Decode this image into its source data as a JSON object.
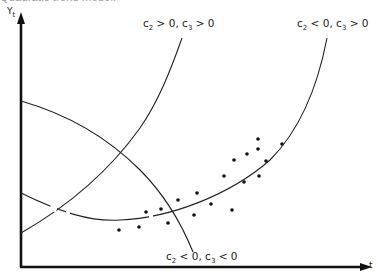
{
  "caption": "Quadratic trend model.",
  "axes": {
    "y_label": "Y",
    "y_subscript": "t",
    "x_label": "t"
  },
  "curves": [
    {
      "label_c2": "c",
      "sub2": "2",
      "rel2": " > 0, ",
      "label_c3": "c",
      "sub3": "3",
      "rel3": " > 0",
      "description": "c2 > 0, c3 > 0"
    },
    {
      "label_c2": "c",
      "sub2": "2",
      "rel2": " < 0, ",
      "label_c3": "c",
      "sub3": "3",
      "rel3": " > 0",
      "description": "c2 < 0, c3 > 0"
    },
    {
      "label_c2": "c",
      "sub2": "2",
      "rel2": " < 0, ",
      "label_c3": "c",
      "sub3": "3",
      "rel3": " < 0",
      "description": "c2 < 0, c3 < 0"
    }
  ],
  "points": [
    [
      119,
      230
    ],
    [
      139,
      227
    ],
    [
      146,
      212
    ],
    [
      161,
      209
    ],
    [
      168,
      223
    ],
    [
      178,
      200
    ],
    [
      194,
      215
    ],
    [
      197,
      193
    ],
    [
      211,
      204
    ],
    [
      224,
      176
    ],
    [
      232,
      210
    ],
    [
      234,
      160
    ],
    [
      244,
      182
    ],
    [
      247,
      154
    ],
    [
      258,
      139
    ],
    [
      258,
      149
    ],
    [
      259,
      176
    ],
    [
      266,
      161
    ],
    [
      282,
      144
    ]
  ]
}
